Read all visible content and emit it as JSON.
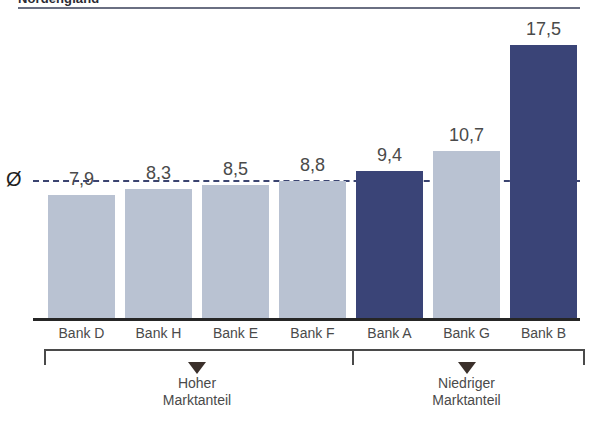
{
  "header": {
    "title": "Nordengland"
  },
  "average": {
    "symbol": "Ø",
    "value": 8.8,
    "label": "Ø"
  },
  "groups": [
    {
      "caption": "Hoher\nMarktanteil",
      "from": 0,
      "to": 3
    },
    {
      "caption": "Niedriger\nMarktanteil",
      "from": 4,
      "to": 6
    }
  ],
  "colors": {
    "light_bar": "#b9c2d2",
    "dark_bar": "#3a4477",
    "axis": "#262626",
    "avg_line": "#3b4470",
    "text": "#4a4a4a",
    "title": "#2b2b33"
  },
  "chart_data": {
    "type": "bar",
    "title": "Nordengland",
    "xlabel": "",
    "ylabel": "",
    "ylim": [
      0,
      18.5
    ],
    "grid": false,
    "legend": "none",
    "categories": [
      "Bank D",
      "Bank H",
      "Bank E",
      "Bank F",
      "Bank A",
      "Bank G",
      "Bank B"
    ],
    "values": [
      7.9,
      8.3,
      8.5,
      8.8,
      9.4,
      10.7,
      17.5
    ],
    "value_labels": [
      "7,9",
      "8,3",
      "8,5",
      "8,8",
      "9,4",
      "10,7",
      "17,5"
    ],
    "bar_colors": [
      "light",
      "light",
      "light",
      "light",
      "dark",
      "light",
      "dark"
    ],
    "annotations": [
      {
        "type": "average-line",
        "label": "Ø",
        "value": 8.8,
        "style": "dashed"
      },
      {
        "type": "group-bracket",
        "label": "Hoher Marktanteil",
        "categories": [
          "Bank D",
          "Bank H",
          "Bank E",
          "Bank F"
        ]
      },
      {
        "type": "group-bracket",
        "label": "Niedriger Marktanteil",
        "categories": [
          "Bank A",
          "Bank G",
          "Bank B"
        ]
      }
    ]
  }
}
